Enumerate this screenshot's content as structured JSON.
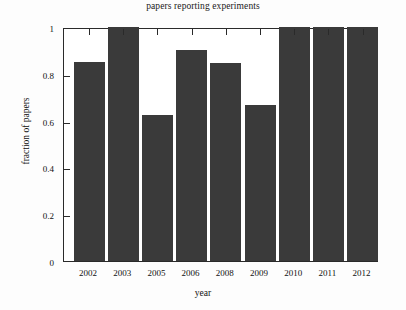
{
  "chart_data": {
    "type": "bar",
    "title": "papers reporting experiments",
    "xlabel": "year",
    "ylabel": "fraction of papers",
    "categories": [
      "2002",
      "2003",
      "2005",
      "2006",
      "2008",
      "2009",
      "2010",
      "2011",
      "2012"
    ],
    "values": [
      0.85,
      1.0,
      0.625,
      0.9,
      0.845,
      0.665,
      1.0,
      1.0,
      1.0
    ],
    "ylim": [
      0,
      1
    ],
    "yticks": [
      0,
      0.2,
      0.4,
      0.6,
      0.8,
      1
    ],
    "ytick_labels": [
      "0",
      "0.2",
      "0.4",
      "0.6",
      "0.8",
      "1"
    ],
    "grid": false,
    "legend": null,
    "bar_color": "#3a3a3a",
    "axis_color": "#2a2a2a",
    "background": "#ffffff"
  }
}
